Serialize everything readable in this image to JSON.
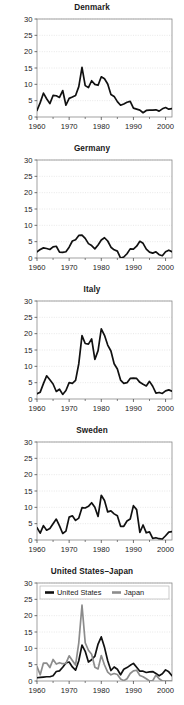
{
  "figure": {
    "panel_count": 5,
    "shared_y_ticks": [
      0,
      5,
      10,
      15,
      20,
      25,
      30
    ],
    "shared_x_ticks": [
      1960,
      1970,
      1980,
      1990,
      2000
    ],
    "x_minor_ticks": [
      1965,
      1975,
      1985,
      1995
    ],
    "colors": {
      "primary_series": "#111111",
      "secondary_series": "#8c8c8c",
      "grid": "#d9d9d9",
      "frame": "#8a8a8a",
      "background": "#ffffff",
      "text": "#1a1a1a"
    }
  },
  "chart_data": [
    {
      "type": "line",
      "title": "Denmark",
      "xlabel": "",
      "ylabel": "",
      "xlim": [
        1960,
        2002
      ],
      "ylim": [
        0,
        30
      ],
      "grid": true,
      "legend": null,
      "x": [
        1960,
        1961,
        1962,
        1963,
        1964,
        1965,
        1966,
        1967,
        1968,
        1969,
        1970,
        1971,
        1972,
        1973,
        1974,
        1975,
        1976,
        1977,
        1978,
        1979,
        1980,
        1981,
        1982,
        1983,
        1984,
        1985,
        1986,
        1987,
        1988,
        1989,
        1990,
        1991,
        1992,
        1993,
        1994,
        1995,
        1996,
        1997,
        1998,
        1999,
        2000,
        2001,
        2002
      ],
      "values": [
        2.0,
        4.4,
        7.3,
        5.6,
        4.1,
        6.6,
        6.5,
        6.0,
        8.1,
        3.6,
        5.7,
        6.1,
        6.6,
        9.3,
        15.2,
        9.6,
        9.0,
        11.1,
        10.0,
        9.7,
        12.3,
        11.7,
        10.1,
        6.9,
        6.3,
        4.7,
        3.6,
        4.0,
        4.5,
        4.8,
        2.7,
        2.4,
        2.1,
        1.3,
        2.0,
        2.1,
        2.1,
        2.2,
        1.8,
        2.5,
        2.9,
        2.4,
        2.6
      ]
    },
    {
      "type": "line",
      "title": "Germany",
      "xlabel": "",
      "ylabel": "",
      "xlim": [
        1960,
        2002
      ],
      "ylim": [
        0,
        30
      ],
      "grid": true,
      "legend": null,
      "x": [
        1960,
        1961,
        1962,
        1963,
        1964,
        1965,
        1966,
        1967,
        1968,
        1969,
        1970,
        1971,
        1972,
        1973,
        1974,
        1975,
        1976,
        1977,
        1978,
        1979,
        1980,
        1981,
        1982,
        1983,
        1984,
        1985,
        1986,
        1987,
        1988,
        1989,
        1990,
        1991,
        1992,
        1993,
        1994,
        1995,
        1996,
        1997,
        1998,
        1999,
        2000,
        2001,
        2002
      ],
      "values": [
        1.9,
        2.6,
        3.1,
        2.9,
        2.6,
        3.4,
        3.6,
        1.8,
        1.7,
        1.9,
        3.3,
        5.2,
        5.6,
        6.9,
        7.0,
        6.0,
        4.4,
        3.8,
        2.8,
        4.0,
        5.5,
        6.2,
        5.2,
        3.3,
        2.5,
        2.1,
        0.0,
        0.3,
        1.3,
        2.8,
        2.7,
        3.6,
        5.1,
        4.5,
        2.7,
        1.8,
        1.5,
        1.9,
        1.0,
        0.7,
        1.9,
        2.4,
        1.9
      ]
    },
    {
      "type": "line",
      "title": "Italy",
      "xlabel": "",
      "ylabel": "",
      "xlim": [
        1960,
        2002
      ],
      "ylim": [
        0,
        30
      ],
      "grid": true,
      "legend": null,
      "x": [
        1960,
        1961,
        1962,
        1963,
        1964,
        1965,
        1966,
        1967,
        1968,
        1969,
        1970,
        1971,
        1972,
        1973,
        1974,
        1975,
        1976,
        1977,
        1978,
        1979,
        1980,
        1981,
        1982,
        1983,
        1984,
        1985,
        1986,
        1987,
        1988,
        1989,
        1990,
        1991,
        1992,
        1993,
        1994,
        1995,
        1996,
        1997,
        1998,
        1999,
        2000,
        2001,
        2002
      ],
      "values": [
        1.6,
        2.1,
        4.7,
        7.1,
        5.9,
        4.6,
        2.3,
        3.0,
        1.4,
        2.6,
        5.0,
        4.8,
        5.7,
        10.8,
        19.4,
        17.0,
        16.8,
        18.4,
        12.1,
        14.8,
        21.5,
        19.5,
        16.5,
        14.7,
        10.8,
        9.2,
        5.8,
        4.8,
        5.0,
        6.3,
        6.4,
        6.3,
        5.1,
        4.5,
        4.0,
        5.4,
        3.9,
        1.8,
        2.0,
        1.7,
        2.5,
        2.8,
        2.4
      ]
    },
    {
      "type": "line",
      "title": "Sweden",
      "xlabel": "",
      "ylabel": "",
      "xlim": [
        1960,
        2002
      ],
      "ylim": [
        0,
        30
      ],
      "grid": true,
      "legend": null,
      "x": [
        1960,
        1961,
        1962,
        1963,
        1964,
        1965,
        1966,
        1967,
        1968,
        1969,
        1970,
        1971,
        1972,
        1973,
        1974,
        1975,
        1976,
        1977,
        1978,
        1979,
        1980,
        1981,
        1982,
        1983,
        1984,
        1985,
        1986,
        1987,
        1988,
        1989,
        1990,
        1991,
        1992,
        1993,
        1994,
        1995,
        1996,
        1997,
        1998,
        1999,
        2000,
        2001,
        2002
      ],
      "values": [
        3.8,
        2.1,
        4.4,
        3.0,
        3.5,
        5.0,
        6.4,
        4.3,
        2.0,
        2.7,
        7.0,
        7.4,
        6.0,
        6.7,
        9.9,
        9.8,
        10.3,
        11.4,
        10.0,
        7.2,
        13.7,
        12.1,
        8.6,
        8.9,
        8.0,
        7.4,
        4.2,
        4.2,
        5.8,
        6.4,
        10.5,
        9.3,
        2.3,
        4.6,
        2.2,
        2.5,
        0.5,
        0.7,
        0.4,
        0.3,
        1.3,
        2.4,
        2.6
      ]
    },
    {
      "type": "line",
      "title": "United States–Japan",
      "xlabel": "",
      "ylabel": "",
      "xlim": [
        1960,
        2002
      ],
      "ylim": [
        0,
        30
      ],
      "grid": true,
      "legend": {
        "position": "top-left",
        "entries": [
          "United States",
          "Japan"
        ]
      },
      "x": [
        1960,
        1961,
        1962,
        1963,
        1964,
        1965,
        1966,
        1967,
        1968,
        1969,
        1970,
        1971,
        1972,
        1973,
        1974,
        1975,
        1976,
        1977,
        1978,
        1979,
        1980,
        1981,
        1982,
        1983,
        1984,
        1985,
        1986,
        1987,
        1988,
        1989,
        1990,
        1991,
        1992,
        1993,
        1994,
        1995,
        1996,
        1997,
        1998,
        1999,
        2000,
        2001,
        2002
      ],
      "series": [
        {
          "name": "United States",
          "color": "#111111",
          "values": [
            1.0,
            1.1,
            1.2,
            1.3,
            1.3,
            1.6,
            2.9,
            3.1,
            4.2,
            5.5,
            5.8,
            4.3,
            3.3,
            6.2,
            11.0,
            9.1,
            5.8,
            6.5,
            7.6,
            11.3,
            13.5,
            10.3,
            6.2,
            3.2,
            4.3,
            3.6,
            1.9,
            3.6,
            4.1,
            4.8,
            5.4,
            4.2,
            3.0,
            3.0,
            2.6,
            2.8,
            2.9,
            2.3,
            1.6,
            2.2,
            3.4,
            2.8,
            1.6
          ]
        },
        {
          "name": "Japan",
          "color": "#8c8c8c",
          "values": [
            4.4,
            1.9,
            5.5,
            5.5,
            4.1,
            6.6,
            5.2,
            5.6,
            5.3,
            5.4,
            7.7,
            6.3,
            4.9,
            11.7,
            23.2,
            11.7,
            9.4,
            8.2,
            4.2,
            3.7,
            7.8,
            4.9,
            2.7,
            1.9,
            2.3,
            2.0,
            0.6,
            0.1,
            0.7,
            2.3,
            3.1,
            3.3,
            1.7,
            1.3,
            0.7,
            -0.1,
            0.1,
            1.8,
            0.7,
            -0.3,
            -0.7,
            -0.7,
            -0.9
          ]
        }
      ]
    }
  ]
}
